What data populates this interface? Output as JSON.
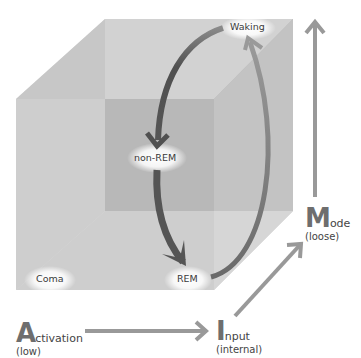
{
  "diagram": {
    "type": "3d-state-space-cube",
    "states": {
      "waking": "Waking",
      "non_rem": "non-REM",
      "rem": "REM",
      "coma": "Coma"
    },
    "axes": {
      "activation": {
        "initial": "A",
        "rest": "ctivation",
        "qualifier": "(low)"
      },
      "input": {
        "initial": "I",
        "rest": "nput",
        "qualifier": "(internal)"
      },
      "mode": {
        "initial": "M",
        "rest": "ode",
        "qualifier": "(loose)"
      }
    },
    "colors": {
      "cube_front": "#c4c4c4",
      "cube_back": "#b0b0b0",
      "cube_top": "#d4d4d4",
      "cube_side": "#c8c8c8",
      "cube_floor": "#d6d6d6",
      "arrow_dark": "#595959",
      "arrow_light": "#8c8c8c",
      "axis_arrow": "#999999"
    }
  }
}
